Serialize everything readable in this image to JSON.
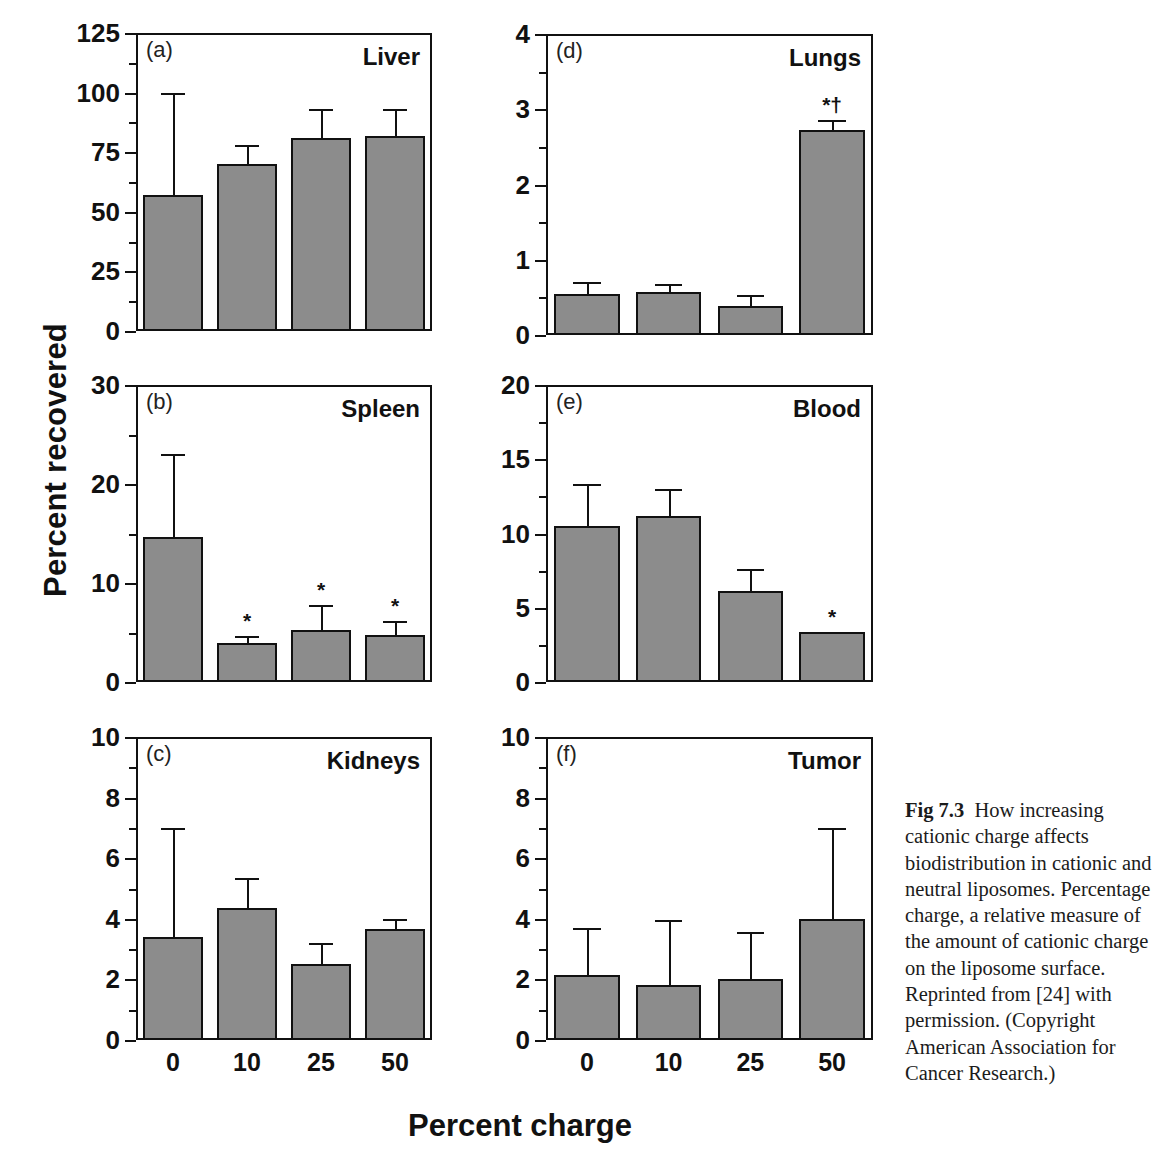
{
  "figure": {
    "ylabel": "Percent recovered",
    "xlabel": "Percent charge",
    "caption_label": "Fig 7.3",
    "caption_text": "How increasing cationic charge affects biodistribution in cationic and neutral liposomes. Percentage charge, a relative measure of the amount of cationic charge on the liposome surface. Reprinted from [24] with permission. (Copyright American Association for Cancer Research.)",
    "bar_color": "#8c8c8c",
    "axis_color": "#111111"
  },
  "chart_data": [
    {
      "type": "bar",
      "panel": "(a)",
      "title": "Liver",
      "xlabel": "Percent charge",
      "ylabel": "Percent recovered",
      "categories": [
        "0",
        "10",
        "25",
        "50"
      ],
      "values": [
        57,
        70,
        81,
        82
      ],
      "errors_upper": [
        100,
        78,
        93,
        93
      ],
      "significance": [
        "",
        "",
        "",
        ""
      ],
      "ylim": [
        0,
        125
      ],
      "yticks": [
        0,
        25,
        50,
        75,
        100,
        125
      ],
      "ytick_labels": [
        "0",
        "25",
        "50",
        "75",
        "100",
        "125"
      ],
      "grid": false
    },
    {
      "type": "bar",
      "panel": "(d)",
      "title": "Lungs",
      "xlabel": "Percent charge",
      "ylabel": "Percent recovered",
      "categories": [
        "0",
        "10",
        "25",
        "50"
      ],
      "values": [
        0.55,
        0.57,
        0.38,
        2.73
      ],
      "errors_upper": [
        0.71,
        0.68,
        0.53,
        2.86
      ],
      "significance": [
        "",
        "",
        "",
        "*†"
      ],
      "ylim": [
        0,
        4
      ],
      "yticks": [
        0,
        1,
        2,
        3,
        4
      ],
      "ytick_labels": [
        "0",
        "1",
        "2",
        "3",
        "4"
      ],
      "grid": false
    },
    {
      "type": "bar",
      "panel": "(b)",
      "title": "Spleen",
      "xlabel": "Percent charge",
      "ylabel": "Percent recovered",
      "categories": [
        "0",
        "10",
        "25",
        "50"
      ],
      "values": [
        14.6,
        3.9,
        5.3,
        4.7
      ],
      "errors_upper": [
        23.0,
        4.6,
        7.8,
        6.2
      ],
      "significance": [
        "",
        "*",
        "*",
        "*"
      ],
      "ylim": [
        0,
        30
      ],
      "yticks": [
        0,
        10,
        20,
        30
      ],
      "ytick_labels": [
        "0",
        "10",
        "20",
        "30"
      ],
      "grid": false
    },
    {
      "type": "bar",
      "panel": "(e)",
      "title": "Blood",
      "xlabel": "Percent charge",
      "ylabel": "Percent recovered",
      "categories": [
        "0",
        "10",
        "25",
        "50"
      ],
      "values": [
        10.5,
        11.2,
        6.1,
        3.4
      ],
      "errors_upper": [
        13.3,
        13.0,
        7.6,
        3.4
      ],
      "significance": [
        "",
        "",
        "",
        "*"
      ],
      "ylim": [
        0,
        20
      ],
      "yticks": [
        0,
        5,
        10,
        15,
        20
      ],
      "ytick_labels": [
        "0",
        "5",
        "10",
        "15",
        "20"
      ],
      "grid": false
    },
    {
      "type": "bar",
      "panel": "(c)",
      "title": "Kidneys",
      "xlabel": "Percent charge",
      "ylabel": "Percent recovered",
      "categories": [
        "0",
        "10",
        "25",
        "50"
      ],
      "values": [
        3.4,
        4.35,
        2.5,
        3.65
      ],
      "errors_upper": [
        7.0,
        5.35,
        3.2,
        4.0
      ],
      "significance": [
        "",
        "",
        "",
        ""
      ],
      "ylim": [
        0,
        10
      ],
      "yticks": [
        0,
        2,
        4,
        6,
        8,
        10
      ],
      "ytick_labels": [
        "0",
        "2",
        "4",
        "6",
        "8",
        "10"
      ],
      "grid": false
    },
    {
      "type": "bar",
      "panel": "(f)",
      "title": "Tumor",
      "xlabel": "Percent charge",
      "ylabel": "Percent recovered",
      "categories": [
        "0",
        "10",
        "25",
        "50"
      ],
      "values": [
        2.15,
        1.8,
        2.0,
        4.0
      ],
      "errors_upper": [
        3.7,
        3.95,
        3.55,
        7.0
      ],
      "significance": [
        "",
        "",
        "",
        ""
      ],
      "ylim": [
        0,
        10
      ],
      "yticks": [
        0,
        2,
        4,
        6,
        8,
        10
      ],
      "ytick_labels": [
        "0",
        "2",
        "4",
        "6",
        "8",
        "10"
      ],
      "grid": false
    }
  ],
  "panel_layout": [
    {
      "index": 0,
      "left": 136,
      "top": 33,
      "width": 296,
      "height": 298,
      "show_xticks": false
    },
    {
      "index": 1,
      "left": 546,
      "top": 34,
      "width": 327,
      "height": 301,
      "show_xticks": false
    },
    {
      "index": 2,
      "left": 136,
      "top": 385,
      "width": 296,
      "height": 297,
      "show_xticks": false
    },
    {
      "index": 3,
      "left": 546,
      "top": 385,
      "width": 327,
      "height": 297,
      "show_xticks": false
    },
    {
      "index": 4,
      "left": 136,
      "top": 737,
      "width": 296,
      "height": 303,
      "show_xticks": true
    },
    {
      "index": 5,
      "left": 546,
      "top": 737,
      "width": 327,
      "height": 303,
      "show_xticks": true
    }
  ]
}
